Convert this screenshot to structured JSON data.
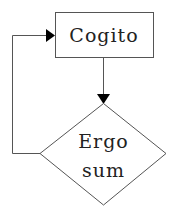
{
  "diagram": {
    "type": "flowchart",
    "nodes": [
      {
        "id": "cogito",
        "shape": "rectangle",
        "label": "Cogito"
      },
      {
        "id": "ergo_sum",
        "shape": "diamond",
        "label_lines": [
          "Ergo",
          "sum"
        ]
      }
    ],
    "edges": [
      {
        "from": "cogito",
        "to": "ergo_sum",
        "direction": "down"
      },
      {
        "from": "ergo_sum",
        "to": "cogito",
        "direction": "loop-left"
      }
    ]
  },
  "colors": {
    "stroke": "#555555",
    "arrowhead": "#000000",
    "text": "#222222",
    "background": "#ffffff"
  }
}
